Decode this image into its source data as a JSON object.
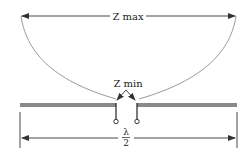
{
  "diagram": {
    "labels": {
      "z_max": "Z max",
      "z_min": "Z min",
      "lambda": "λ",
      "two": "2"
    },
    "colors": {
      "curve": "#9a9a9a",
      "antenna": "#8a8a8a",
      "arrow": "#333333",
      "text": "#222222"
    }
  }
}
